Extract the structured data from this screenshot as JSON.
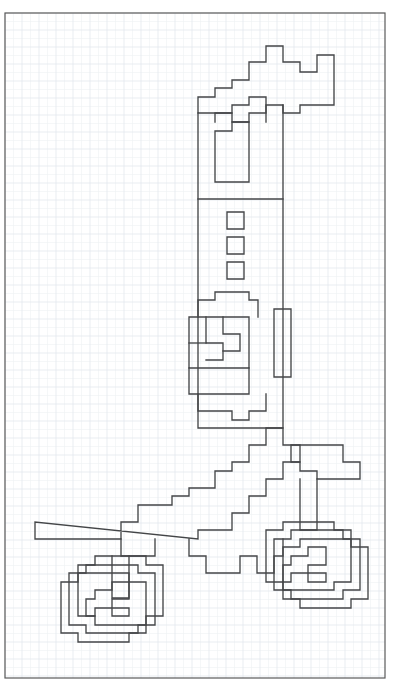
{
  "page": {
    "background_color": "#ffffff",
    "width": 397,
    "height": 695
  },
  "border": {
    "label": "page-border",
    "x": 5,
    "y": 13,
    "width": 380,
    "height": 665,
    "stroke_color": "#5a5a5a",
    "stroke_width": 1.2
  },
  "grid": {
    "label": "graph-paper-grid",
    "visible": true,
    "cell_size": 8.5,
    "major_every": 2,
    "minor_color": "#eef1f4",
    "major_color": "#e3e8ee",
    "origin_x": 5,
    "origin_y": 13
  },
  "drawing": {
    "label": "pixel-art-motorcycle",
    "subject": "motorcycle",
    "style": "orthogonal grid-snapped outline",
    "ink_color": "#444648",
    "ink_width": 1.35,
    "grid_step": 17,
    "parts": [
      {
        "name": "handlebar-and-fork",
        "description": "stepped diagonal mast rising to upper right with two raised knobs"
      },
      {
        "name": "seat-post-column",
        "description": "tall vertical column with three small square vents"
      },
      {
        "name": "engine-block",
        "description": "rectangular body with inner stepped notches"
      },
      {
        "name": "side-panel",
        "description": "narrow vertical panel on the right of the column"
      },
      {
        "name": "frame-spar",
        "description": "long stepped diagonal bar descending to the lower left"
      },
      {
        "name": "front-wheel",
        "description": "concentric stepped octagonal wheel, lower left"
      },
      {
        "name": "rear-wheel",
        "description": "concentric stepped octagonal wheel, lower right"
      },
      {
        "name": "exhaust-tail",
        "description": "stepped tail piece at lower right of the frame"
      }
    ]
  },
  "paths": {
    "handlebar_mast": "M 198 113 L 198 97 L 215 97 L 215 88 L 232 88 L 232 80 L 249 80 L 249 62 L 266 62 L 266 46 L 283 46 L 283 62 L 300 62 L 300 72 L 317 72 L 317 55 L 334 55 L 334 105 L 300 105 L 300 113 L 283 113 L 283 105 L 266 105 L 266 113 L 249 113 L 249 122 L 232 122 L 232 113 Z",
    "mast_inner": "M 215 122 L 215 113 L 232 113 L 232 105 L 249 105 L 249 97 L 266 97 L 266 122",
    "inner_pocket": "M 215 182 L 215 131 L 232 131 L 232 122 L 249 122 L 249 182 Z",
    "column_outline": "M 198 113 L 198 428 L 283 428 L 283 105",
    "column_divider": "M 198 199 L 283 199",
    "vent_1": "M 227 212 L 244 212 L 244 229 L 227 229 Z",
    "vent_2": "M 227 237 L 244 237 L 244 254 L 227 254 Z",
    "vent_3": "M 227 262 L 244 262 L 244 279 L 227 279 Z",
    "engine_top": "M 198 317 L 198 300 L 215 300 L 215 292 L 249 292 L 249 300 L 258 300 L 258 317",
    "engine_box": "M 189 317 L 249 317 L 249 368 L 189 368 Z",
    "engine_inner_a": "M 206 317 L 206 343 L 223 343 L 223 360 L 206 360",
    "engine_inner_b": "M 223 317 L 223 334 L 240 334 L 240 351 L 223 351",
    "engine_inner_c": "M 189 343 L 206 343",
    "engine_lower": "M 189 368 L 189 394 L 249 394 L 249 368",
    "engine_base": "M 198 394 L 198 411 L 232 411 L 232 420 L 249 420 L 249 411 L 266 411 L 266 394",
    "side_panel": "M 274 309 L 291 309 L 291 377 L 274 377 Z",
    "frame_spar": "M 35 522 L 35 539 L 121 539 L 121 522 L 138 522 L 138 505 L 172 505 L 172 496 L 189 496 L 189 488 L 215 488 L 215 471 L 232 471 L 232 462 L 249 462 L 249 445 L 266 445 L 266 428 L 283 428 L 283 445 L 300 445 L 300 462 L 283 462 L 283 479 L 266 479 L 266 496 L 249 496 L 249 513 L 232 513 L 232 530 L 198 530 L 198 539 Z",
    "spar_notch": "M 121 539 L 121 556 L 155 556 L 155 539",
    "tail_upper": "M 291 462 L 291 445 L 343 445 L 343 462 L 360 462 L 360 479 L 317 479 L 317 471 L 300 471 L 300 462 Z",
    "tail_lower": "M 189 539 L 189 556 L 206 556 L 206 573 L 240 573 L 240 556 L 257 556 L 257 573 L 274 573 L 274 556 L 283 556 L 283 539",
    "hub_stem_left": "M 112 556 L 112 598 L 129 598 L 129 556",
    "hub_stem_right": "M 300 479 L 300 530 L 317 530 L 317 479",
    "wheel_left_o1": "M 78 565 L 95 565 L 95 556 L 146 556 L 146 565 L 163 565 L 163 616 L 146 616 L 146 625 L 95 625 L 95 616 L 78 616 Z",
    "wheel_left_o2": "M 69 573 L 86 573 L 86 565 L 138 565 L 138 573 L 155 573 L 155 625 L 138 625 L 138 633 L 86 633 L 86 625 L 69 625 Z",
    "wheel_left_o3": "M 61 582 L 78 582 L 78 573 L 129 573 L 129 582 L 146 582 L 146 633 L 129 633 L 129 642 L 78 642 L 78 633 L 61 633 Z",
    "wheel_left_i1": "M 95 590 L 112 590 L 112 582 L 129 582 L 129 599 L 112 599 L 112 608 L 129 608 L 129 616 L 112 616 L 112 608 L 95 608 L 95 616 L 86 616 L 86 599 L 95 599 Z",
    "wheel_right_o1": "M 266 530 L 283 530 L 283 522 L 334 522 L 334 530 L 351 530 L 351 582 L 334 582 L 334 590 L 283 590 L 283 582 L 266 582 Z",
    "wheel_right_o2": "M 274 539 L 291 539 L 291 530 L 343 530 L 343 539 L 360 539 L 360 590 L 343 590 L 343 599 L 291 599 L 291 590 L 274 590 Z",
    "wheel_right_o3": "M 283 547 L 300 547 L 300 539 L 351 539 L 351 547 L 368 547 L 368 599 L 351 599 L 351 608 L 300 608 L 300 599 L 283 599 Z",
    "wheel_right_i1": "M 291 556 L 308 556 L 308 547 L 326 547 L 326 565 L 308 565 L 308 573 L 326 573 L 326 582 L 308 582 L 308 573 L 291 573 L 291 582 L 283 582 L 283 565 L 291 565 Z"
  }
}
